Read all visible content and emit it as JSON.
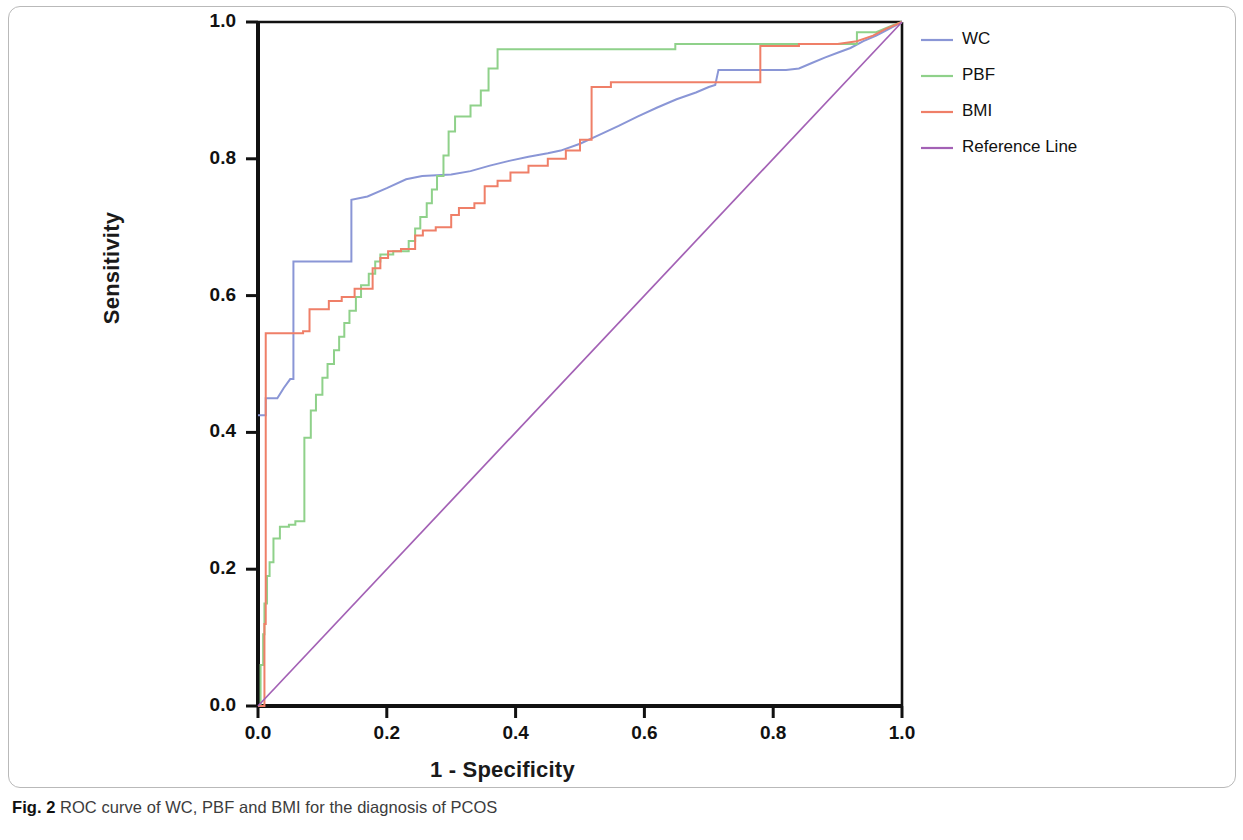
{
  "figure": {
    "caption_label": "Fig. 2",
    "caption_text": " ROC curve of WC, PBF and BMI for the diagnosis of PCOS"
  },
  "chart_data": {
    "type": "line",
    "title": "",
    "subtitle": "",
    "xlabel": "1 - Specificity",
    "ylabel": "Sensitivity",
    "xlim": [
      0.0,
      1.0
    ],
    "ylim": [
      0.0,
      1.0
    ],
    "xticks": [
      "0.0",
      "0.2",
      "0.4",
      "0.6",
      "0.8",
      "1.0"
    ],
    "yticks": [
      "0.0",
      "0.2",
      "0.4",
      "0.6",
      "0.8",
      "1.0"
    ],
    "xtick_values": [
      0.0,
      0.2,
      0.4,
      0.6,
      0.8,
      1.0
    ],
    "ytick_values": [
      0.0,
      0.2,
      0.4,
      0.6,
      0.8,
      1.0
    ],
    "grid": false,
    "legend_position": "right",
    "colors": {
      "WC": "#8a96d6",
      "PBF": "#8fd18a",
      "BMI": "#ef7f68",
      "Reference Line": "#a361b5"
    },
    "series": [
      {
        "name": "WC",
        "color": "#8a96d6",
        "points": [
          [
            0.0,
            0.425
          ],
          [
            0.012,
            0.425
          ],
          [
            0.012,
            0.45
          ],
          [
            0.03,
            0.45
          ],
          [
            0.04,
            0.465
          ],
          [
            0.05,
            0.478
          ],
          [
            0.055,
            0.478
          ],
          [
            0.055,
            0.65
          ],
          [
            0.145,
            0.65
          ],
          [
            0.145,
            0.74
          ],
          [
            0.17,
            0.745
          ],
          [
            0.2,
            0.757
          ],
          [
            0.23,
            0.77
          ],
          [
            0.255,
            0.775
          ],
          [
            0.3,
            0.777
          ],
          [
            0.33,
            0.782
          ],
          [
            0.36,
            0.79
          ],
          [
            0.39,
            0.797
          ],
          [
            0.42,
            0.803
          ],
          [
            0.45,
            0.808
          ],
          [
            0.47,
            0.812
          ],
          [
            0.5,
            0.822
          ],
          [
            0.53,
            0.835
          ],
          [
            0.56,
            0.848
          ],
          [
            0.59,
            0.862
          ],
          [
            0.62,
            0.875
          ],
          [
            0.65,
            0.887
          ],
          [
            0.68,
            0.897
          ],
          [
            0.7,
            0.905
          ],
          [
            0.71,
            0.908
          ],
          [
            0.715,
            0.93
          ],
          [
            0.74,
            0.93
          ],
          [
            0.78,
            0.93
          ],
          [
            0.82,
            0.93
          ],
          [
            0.84,
            0.932
          ],
          [
            0.86,
            0.94
          ],
          [
            0.88,
            0.948
          ],
          [
            0.9,
            0.955
          ],
          [
            0.92,
            0.962
          ],
          [
            0.94,
            0.972
          ],
          [
            0.96,
            0.98
          ],
          [
            0.98,
            0.99
          ],
          [
            1.0,
            1.0
          ]
        ]
      },
      {
        "name": "PBF",
        "color": "#8fd18a",
        "points": [
          [
            0.0,
            0.0
          ],
          [
            0.004,
            0.0
          ],
          [
            0.004,
            0.06
          ],
          [
            0.008,
            0.06
          ],
          [
            0.008,
            0.105
          ],
          [
            0.01,
            0.105
          ],
          [
            0.01,
            0.15
          ],
          [
            0.014,
            0.15
          ],
          [
            0.014,
            0.19
          ],
          [
            0.018,
            0.19
          ],
          [
            0.018,
            0.21
          ],
          [
            0.024,
            0.21
          ],
          [
            0.024,
            0.245
          ],
          [
            0.034,
            0.245
          ],
          [
            0.034,
            0.262
          ],
          [
            0.048,
            0.262
          ],
          [
            0.048,
            0.265
          ],
          [
            0.058,
            0.265
          ],
          [
            0.058,
            0.27
          ],
          [
            0.072,
            0.27
          ],
          [
            0.072,
            0.392
          ],
          [
            0.082,
            0.392
          ],
          [
            0.082,
            0.432
          ],
          [
            0.09,
            0.432
          ],
          [
            0.09,
            0.455
          ],
          [
            0.1,
            0.455
          ],
          [
            0.1,
            0.48
          ],
          [
            0.108,
            0.48
          ],
          [
            0.108,
            0.5
          ],
          [
            0.118,
            0.5
          ],
          [
            0.118,
            0.52
          ],
          [
            0.126,
            0.52
          ],
          [
            0.126,
            0.54
          ],
          [
            0.134,
            0.54
          ],
          [
            0.134,
            0.56
          ],
          [
            0.142,
            0.56
          ],
          [
            0.142,
            0.578
          ],
          [
            0.152,
            0.578
          ],
          [
            0.152,
            0.598
          ],
          [
            0.16,
            0.598
          ],
          [
            0.16,
            0.615
          ],
          [
            0.172,
            0.615
          ],
          [
            0.172,
            0.632
          ],
          [
            0.182,
            0.632
          ],
          [
            0.182,
            0.65
          ],
          [
            0.19,
            0.65
          ],
          [
            0.19,
            0.66
          ],
          [
            0.21,
            0.66
          ],
          [
            0.21,
            0.665
          ],
          [
            0.234,
            0.665
          ],
          [
            0.234,
            0.68
          ],
          [
            0.244,
            0.68
          ],
          [
            0.244,
            0.698
          ],
          [
            0.252,
            0.698
          ],
          [
            0.252,
            0.715
          ],
          [
            0.262,
            0.715
          ],
          [
            0.262,
            0.735
          ],
          [
            0.27,
            0.735
          ],
          [
            0.27,
            0.755
          ],
          [
            0.278,
            0.755
          ],
          [
            0.278,
            0.775
          ],
          [
            0.288,
            0.775
          ],
          [
            0.288,
            0.805
          ],
          [
            0.296,
            0.805
          ],
          [
            0.296,
            0.84
          ],
          [
            0.306,
            0.84
          ],
          [
            0.306,
            0.862
          ],
          [
            0.33,
            0.862
          ],
          [
            0.33,
            0.878
          ],
          [
            0.346,
            0.878
          ],
          [
            0.346,
            0.9
          ],
          [
            0.358,
            0.9
          ],
          [
            0.358,
            0.932
          ],
          [
            0.372,
            0.932
          ],
          [
            0.372,
            0.96
          ],
          [
            0.48,
            0.96
          ],
          [
            0.48,
            0.96
          ],
          [
            0.648,
            0.96
          ],
          [
            0.648,
            0.968
          ],
          [
            0.93,
            0.968
          ],
          [
            0.93,
            0.985
          ],
          [
            0.96,
            0.985
          ],
          [
            0.985,
            0.995
          ],
          [
            1.0,
            1.0
          ]
        ]
      },
      {
        "name": "BMI",
        "color": "#ef7f68",
        "points": [
          [
            0.0,
            0.0
          ],
          [
            0.01,
            0.0
          ],
          [
            0.01,
            0.12
          ],
          [
            0.012,
            0.12
          ],
          [
            0.012,
            0.545
          ],
          [
            0.07,
            0.545
          ],
          [
            0.07,
            0.548
          ],
          [
            0.08,
            0.548
          ],
          [
            0.08,
            0.58
          ],
          [
            0.11,
            0.58
          ],
          [
            0.11,
            0.592
          ],
          [
            0.13,
            0.592
          ],
          [
            0.13,
            0.598
          ],
          [
            0.15,
            0.598
          ],
          [
            0.15,
            0.61
          ],
          [
            0.178,
            0.61
          ],
          [
            0.178,
            0.64
          ],
          [
            0.19,
            0.64
          ],
          [
            0.19,
            0.655
          ],
          [
            0.202,
            0.655
          ],
          [
            0.202,
            0.665
          ],
          [
            0.222,
            0.665
          ],
          [
            0.222,
            0.668
          ],
          [
            0.244,
            0.668
          ],
          [
            0.244,
            0.688
          ],
          [
            0.256,
            0.688
          ],
          [
            0.256,
            0.695
          ],
          [
            0.276,
            0.695
          ],
          [
            0.276,
            0.7
          ],
          [
            0.3,
            0.7
          ],
          [
            0.3,
            0.718
          ],
          [
            0.312,
            0.718
          ],
          [
            0.312,
            0.728
          ],
          [
            0.336,
            0.728
          ],
          [
            0.336,
            0.735
          ],
          [
            0.352,
            0.735
          ],
          [
            0.352,
            0.76
          ],
          [
            0.372,
            0.76
          ],
          [
            0.372,
            0.768
          ],
          [
            0.392,
            0.768
          ],
          [
            0.392,
            0.78
          ],
          [
            0.42,
            0.78
          ],
          [
            0.42,
            0.79
          ],
          [
            0.45,
            0.79
          ],
          [
            0.45,
            0.8
          ],
          [
            0.478,
            0.8
          ],
          [
            0.478,
            0.812
          ],
          [
            0.5,
            0.812
          ],
          [
            0.5,
            0.828
          ],
          [
            0.518,
            0.828
          ],
          [
            0.518,
            0.905
          ],
          [
            0.548,
            0.905
          ],
          [
            0.548,
            0.912
          ],
          [
            0.6,
            0.912
          ],
          [
            0.6,
            0.912
          ],
          [
            0.7,
            0.912
          ],
          [
            0.78,
            0.912
          ],
          [
            0.78,
            0.965
          ],
          [
            0.84,
            0.965
          ],
          [
            0.84,
            0.968
          ],
          [
            0.9,
            0.968
          ],
          [
            0.93,
            0.972
          ],
          [
            0.955,
            0.98
          ],
          [
            0.975,
            0.99
          ],
          [
            1.0,
            1.0
          ]
        ]
      },
      {
        "name": "Reference Line",
        "color": "#a361b5",
        "points": [
          [
            0.0,
            0.0
          ],
          [
            1.0,
            1.0
          ]
        ]
      }
    ],
    "legend": [
      {
        "label": "WC",
        "color": "#8a96d6"
      },
      {
        "label": "PBF",
        "color": "#8fd18a"
      },
      {
        "label": "BMI",
        "color": "#ef7f68"
      },
      {
        "label": "Reference Line",
        "color": "#a361b5"
      }
    ]
  }
}
